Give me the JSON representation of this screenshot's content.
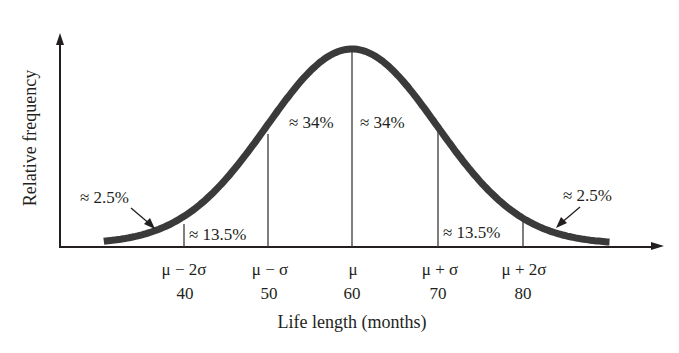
{
  "chart_data": {
    "type": "area",
    "title": "",
    "xlabel": "Life length (months)",
    "ylabel": "Relative frequency",
    "distribution": {
      "mean": 60,
      "sd": 10
    },
    "x_ticks": [
      {
        "symbol": "μ − 2σ",
        "value": "40"
      },
      {
        "symbol": "μ − σ",
        "value": "50"
      },
      {
        "symbol": "μ",
        "value": "60"
      },
      {
        "symbol": "μ + σ",
        "value": "70"
      },
      {
        "symbol": "μ + 2σ",
        "value": "80"
      }
    ],
    "regions": [
      {
        "range": "< 40",
        "label": "≈ 2.5%",
        "percent": 2.5
      },
      {
        "range": "40–50",
        "label": "≈ 13.5%",
        "percent": 13.5
      },
      {
        "range": "50–60",
        "label": "≈ 34%",
        "percent": 34
      },
      {
        "range": "60–70",
        "label": "≈ 34%",
        "percent": 34
      },
      {
        "range": "70–80",
        "label": "≈ 13.5%",
        "percent": 13.5
      },
      {
        "range": "> 80",
        "label": "≈ 2.5%",
        "percent": 2.5
      }
    ],
    "x_range": [
      30,
      90
    ],
    "grid": false,
    "legend": null,
    "colors": {
      "curve": "#3a3a3a",
      "axis": "#231f20",
      "dividers": "#3a3a3a"
    }
  }
}
